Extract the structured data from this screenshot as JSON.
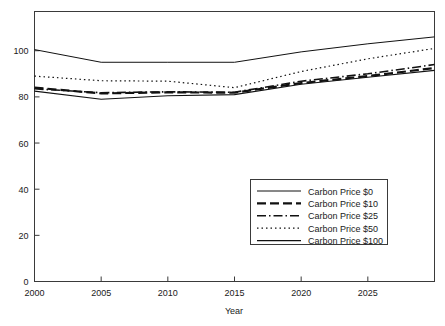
{
  "chart_data": {
    "type": "line",
    "title": "",
    "xlabel": "Year",
    "ylabel": "",
    "xlim": [
      2000,
      2030
    ],
    "ylim": [
      0,
      117
    ],
    "grid": false,
    "legend_position": "lower-right-inside",
    "xticks": [
      2000,
      2005,
      2010,
      2015,
      2020,
      2025
    ],
    "yticks": [
      0,
      20,
      40,
      60,
      80,
      100
    ],
    "x": [
      2000,
      2005,
      2010,
      2015,
      2020,
      2025,
      2030
    ],
    "series": [
      {
        "name": "Carbon Price $0",
        "style": "solid-thin",
        "values": [
          100.5,
          95.0,
          95.0,
          95.0,
          99.5,
          103.0,
          106.0
        ]
      },
      {
        "name": "Carbon Price $10",
        "style": "dashed",
        "values": [
          84.0,
          81.5,
          82.0,
          81.8,
          86.0,
          89.0,
          92.5
        ]
      },
      {
        "name": "Carbon Price $25",
        "style": "dash-dot",
        "values": [
          83.5,
          81.8,
          82.2,
          82.0,
          86.8,
          90.0,
          94.0
        ]
      },
      {
        "name": "Carbon Price $50",
        "style": "dotted",
        "values": [
          89.0,
          87.0,
          86.8,
          84.0,
          91.0,
          96.5,
          101.0
        ]
      },
      {
        "name": "Carbon Price $100",
        "style": "solid-thick",
        "values": [
          82.5,
          79.0,
          80.5,
          81.0,
          85.5,
          88.5,
          91.5
        ]
      }
    ]
  },
  "axes": {
    "x_tick_labels": [
      "2000",
      "2005",
      "2010",
      "2015",
      "2020",
      "2025"
    ],
    "y_tick_labels": [
      "0",
      "20",
      "40",
      "60",
      "80",
      "100"
    ],
    "x_axis_title": "Year"
  },
  "legend": {
    "entries": [
      {
        "label": "Carbon Price $0"
      },
      {
        "label": "Carbon Price $10"
      },
      {
        "label": "Carbon Price $25"
      },
      {
        "label": "Carbon Price $50"
      },
      {
        "label": "Carbon Price $100"
      }
    ]
  },
  "colors": {
    "line": "#111111",
    "axis": "#3a3a3a",
    "text": "#1a1a1a",
    "background": "#ffffff"
  }
}
